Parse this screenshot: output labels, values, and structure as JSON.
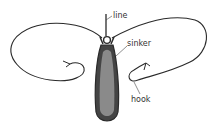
{
  "diagram": {
    "labels": {
      "line": "line",
      "sinker": "sinker",
      "hook": "hook"
    },
    "colors": {
      "stroke": "#2a2a2a",
      "sinker_fill": "#8a8a8a",
      "sinker_outline": "#3a3a3a",
      "label": "#333333"
    }
  }
}
